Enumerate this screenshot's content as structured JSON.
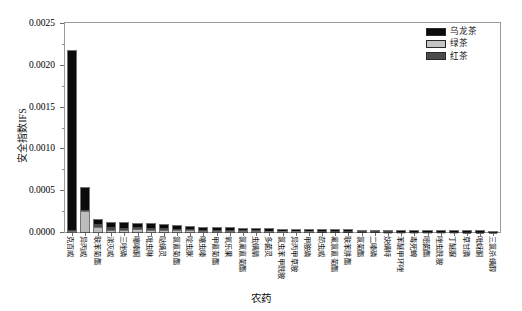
{
  "chart_data": {
    "type": "bar",
    "subtype": "stacked-vertical",
    "title": "",
    "xlabel": "农药",
    "ylabel": "安全指数IFS",
    "ylim": [
      0.0,
      0.0025
    ],
    "ytick_labels": [
      "0.0000",
      "0.0005",
      "0.0010",
      "0.0015",
      "0.0020",
      "0.0025"
    ],
    "ytick_values": [
      0.0,
      0.0005,
      0.001,
      0.0015,
      0.002,
      0.0025
    ],
    "minor_ticks": true,
    "grid": false,
    "legend_position": "top-right",
    "legend": [
      "乌龙茶",
      "绿茶",
      "红茶"
    ],
    "series_colors": [
      "#0b0b0b",
      "#c3c3c3",
      "#4a4a4a"
    ],
    "categories": [
      "克百威",
      "异丙威",
      "联苯菊酯",
      "涕灭威",
      "三唑磷",
      "噻嗪酮",
      "吡虫啉",
      "哒螨灵",
      "氯氰菊酯",
      "啶虫脒",
      "噻虫嗪",
      "甲氰菊酯",
      "氧乐果",
      "氯氟氰菊酯",
      "虫螨腈",
      "多菌灵",
      "氯虫苯甲酰胺",
      "异丙甲草胺",
      "甲胺磷",
      "茚虫威",
      "氟氯氰菊酯",
      "联苯肼酯",
      "氯菊酯",
      "二嗪磷",
      "炔螨特",
      "苯醚甲环唑",
      "毒死蜱",
      "嘧菌酯",
      "唑虫酰胺",
      "丁醚脲",
      "草甘膦",
      "吡蚜酮",
      "三氯杀螨醇"
    ],
    "series": [
      {
        "name": "乌龙茶",
        "color": "#0b0b0b",
        "values": [
          0.00215,
          0.00027,
          3.8e-05,
          5.5e-05,
          6.2e-05,
          4e-05,
          4.8e-05,
          3e-05,
          3.2e-05,
          2.6e-05,
          2.4e-05,
          2.2e-05,
          1.9e-05,
          1.8e-05,
          1.6e-05,
          1.5e-05,
          1.3e-05,
          1.2e-05,
          1.1e-05,
          1e-05,
          9e-06,
          8e-06,
          8e-06,
          7e-06,
          6e-06,
          6e-06,
          5e-06,
          5e-06,
          4e-06,
          4e-06,
          3e-06,
          3e-06,
          2e-06
        ]
      },
      {
        "name": "绿茶",
        "color": "#c3c3c3",
        "values": [
          1.5e-05,
          0.00025,
          5.5e-05,
          2.2e-05,
          2e-05,
          3e-05,
          1.8e-05,
          2.8e-05,
          2e-05,
          1.8e-05,
          1.6e-05,
          1.4e-05,
          1.3e-05,
          1.2e-05,
          1.1e-05,
          1e-05,
          9e-06,
          8e-06,
          8e-06,
          7e-06,
          6e-06,
          6e-06,
          5e-06,
          5e-06,
          4e-06,
          4e-06,
          4e-06,
          3e-06,
          3e-06,
          3e-06,
          2e-06,
          2e-06,
          2e-06
        ]
      },
      {
        "name": "红茶",
        "color": "#4a4a4a",
        "values": [
          5e-06,
          1e-05,
          4.5e-05,
          3.3e-05,
          2.8e-05,
          3e-05,
          2.4e-05,
          2.2e-05,
          1.8e-05,
          1.6e-05,
          1.4e-05,
          1.3e-05,
          1.2e-05,
          1e-05,
          9e-06,
          8e-06,
          8e-06,
          7e-06,
          6e-06,
          6e-06,
          5e-06,
          5e-06,
          4e-06,
          4e-06,
          4e-06,
          3e-06,
          3e-06,
          3e-06,
          2e-06,
          2e-06,
          2e-06,
          2e-06,
          1e-06
        ]
      }
    ]
  },
  "axes": {
    "y_title": "安全指数IFS",
    "x_title": "农药"
  },
  "legend": {
    "items": [
      {
        "label": "乌龙茶",
        "color": "#0b0b0b",
        "swatch": "oolong"
      },
      {
        "label": "绿茶",
        "color": "#c3c3c3",
        "swatch": "green"
      },
      {
        "label": "红茶",
        "color": "#4a4a4a",
        "swatch": "black"
      }
    ]
  },
  "top_strip": {
    "text": ""
  }
}
